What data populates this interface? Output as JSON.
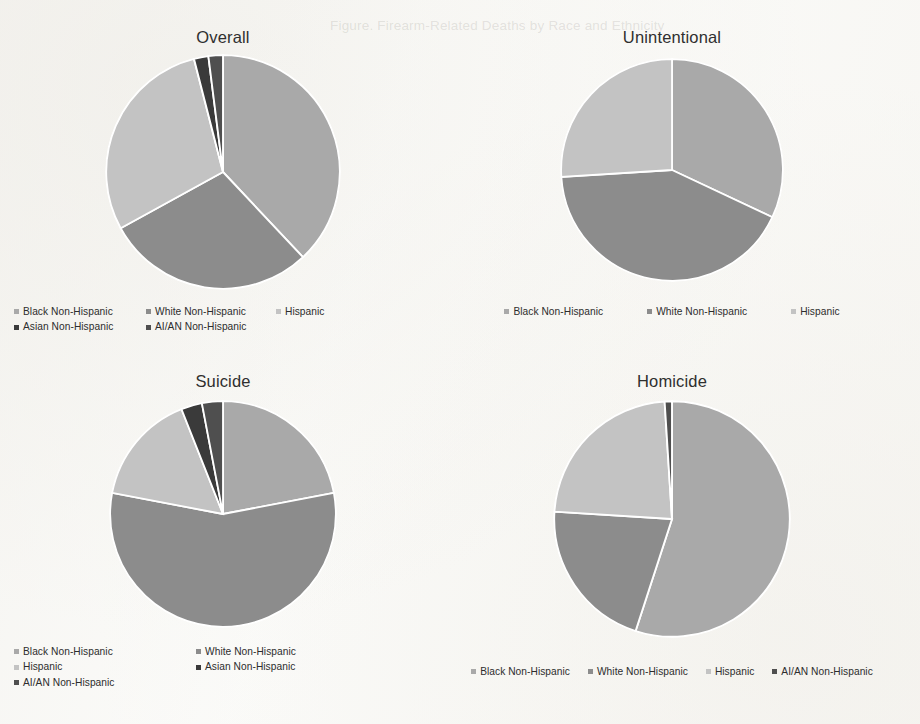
{
  "page": {
    "background_color": "#fbfbf9",
    "bleed_through_text": "Figure. Firearm-Related Deaths by Race and Ethnicity"
  },
  "palette": {
    "black_non_hispanic": "#a9a9a9",
    "white_non_hispanic": "#8c8c8c",
    "hispanic": "#c3c3c3",
    "asian_non_hispanic": "#3a3a3a",
    "ai_an_non_hispanic": "#4f4f4f",
    "slice_border": "#ffffff",
    "title_color": "#2f2f2f",
    "legend_text_color": "#2d2d2d"
  },
  "chart_data": [
    {
      "type": "pie",
      "title": "Overall",
      "id": "overall",
      "legend_position": "bottom-left",
      "legend_columns": 3,
      "categories": [
        "Black Non-Hispanic",
        "White Non-Hispanic",
        "Hispanic",
        "Asian Non-Hispanic",
        "AI/AN Non-Hispanic"
      ],
      "values": [
        38,
        29,
        29,
        2,
        2
      ],
      "colors": [
        "#a9a9a9",
        "#8c8c8c",
        "#c3c3c3",
        "#3a3a3a",
        "#4f4f4f"
      ],
      "legend_rows": [
        [
          "Black Non-Hispanic",
          "White Non-Hispanic",
          "Hispanic"
        ],
        [
          "Asian Non-Hispanic",
          "AI/AN Non-Hispanic"
        ]
      ]
    },
    {
      "type": "pie",
      "title": "Unintentional",
      "id": "unintentional",
      "legend_position": "bottom-center",
      "legend_columns": 3,
      "categories": [
        "Black Non-Hispanic",
        "White Non-Hispanic",
        "Hispanic"
      ],
      "values": [
        32,
        42,
        26
      ],
      "colors": [
        "#a9a9a9",
        "#8c8c8c",
        "#c3c3c3"
      ],
      "legend_rows": [
        [
          "Black Non-Hispanic",
          "White Non-Hispanic",
          "Hispanic"
        ]
      ]
    },
    {
      "type": "pie",
      "title": "Suicide",
      "id": "suicide",
      "legend_position": "bottom-left",
      "legend_columns": 2,
      "categories": [
        "Black Non-Hispanic",
        "White Non-Hispanic",
        "Hispanic",
        "Asian Non-Hispanic",
        "AI/AN Non-Hispanic"
      ],
      "values": [
        22,
        56,
        16,
        3,
        3
      ],
      "colors": [
        "#a9a9a9",
        "#8c8c8c",
        "#c3c3c3",
        "#3a3a3a",
        "#4f4f4f"
      ],
      "legend_rows": [
        [
          "Black Non-Hispanic",
          "White Non-Hispanic"
        ],
        [
          "Hispanic",
          "Asian Non-Hispanic"
        ],
        [
          "AI/AN Non-Hispanic"
        ]
      ]
    },
    {
      "type": "pie",
      "title": "Homicide",
      "id": "homicide",
      "legend_position": "bottom-center",
      "legend_columns": 4,
      "categories": [
        "Black Non-Hispanic",
        "White Non-Hispanic",
        "Hispanic",
        "AI/AN Non-Hispanic"
      ],
      "values": [
        55,
        21,
        23,
        1
      ],
      "colors": [
        "#a9a9a9",
        "#8c8c8c",
        "#c3c3c3",
        "#4f4f4f"
      ],
      "legend_rows": [
        [
          "Black Non-Hispanic",
          "White Non-Hispanic",
          "Hispanic",
          "AI/AN Non-Hispanic"
        ]
      ]
    }
  ]
}
